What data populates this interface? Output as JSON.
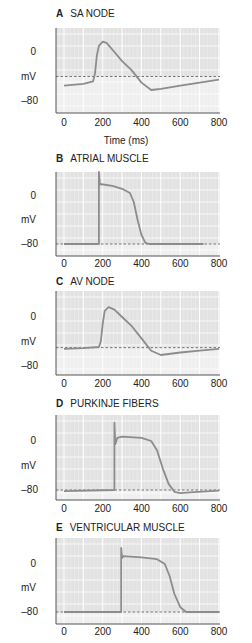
{
  "figure": {
    "xlabel": "Time (ms)",
    "ylabel": "mV",
    "colors": {
      "upper_bg": "#e2e2e2",
      "lower_bg": "#efefef",
      "grid": "#f8f8f8",
      "trace": "#8c8c8c",
      "axis": "#555555",
      "dashed": "#555555"
    }
  },
  "chart_data": [
    {
      "type": "line",
      "panel": "A",
      "title": "SA NODE",
      "xlabel": "Time (ms)",
      "ylabel": "mV",
      "xticks": [
        "0",
        "200",
        "400",
        "600",
        "800"
      ],
      "yticks": [
        "0",
        "-80"
      ],
      "xlim": [
        0,
        800
      ],
      "ylim": [
        -110,
        45
      ],
      "threshold": -40,
      "x": [
        0,
        100,
        150,
        160,
        170,
        180,
        200,
        220,
        260,
        300,
        350,
        400,
        450,
        500,
        600,
        700,
        800
      ],
      "y": [
        -55,
        -52,
        -48,
        -35,
        -5,
        10,
        17,
        15,
        0,
        -15,
        -30,
        -50,
        -62,
        -60,
        -55,
        -50,
        -45
      ]
    },
    {
      "type": "line",
      "panel": "B",
      "title": "ATRIAL MUSCLE",
      "xlabel": "",
      "ylabel": "mV",
      "xticks": [
        "0",
        "200",
        "400",
        "600",
        "800"
      ],
      "yticks": [
        "0",
        "-80"
      ],
      "xlim": [
        0,
        800
      ],
      "ylim": [
        -100,
        40
      ],
      "threshold": -80,
      "x": [
        0,
        180,
        180,
        185,
        250,
        300,
        340,
        360,
        380,
        400,
        420,
        440,
        720
      ],
      "y": [
        -80,
        -80,
        40,
        20,
        17,
        12,
        5,
        -10,
        -40,
        -65,
        -78,
        -80,
        -80
      ]
    },
    {
      "type": "line",
      "panel": "C",
      "title": "AV NODE",
      "xlabel": "",
      "ylabel": "mV",
      "xticks": [
        "0",
        "200",
        "400",
        "600",
        "800"
      ],
      "yticks": [
        "0",
        "-80"
      ],
      "xlim": [
        0,
        800
      ],
      "ylim": [
        -110,
        45
      ],
      "threshold": -50,
      "x": [
        0,
        100,
        180,
        190,
        200,
        210,
        230,
        260,
        300,
        350,
        400,
        450,
        500,
        600,
        700,
        800
      ],
      "y": [
        -52,
        -51,
        -49,
        -40,
        -10,
        10,
        16,
        12,
        0,
        -15,
        -35,
        -55,
        -62,
        -58,
        -55,
        -52
      ]
    },
    {
      "type": "line",
      "panel": "D",
      "title": "PURKINJE FIBERS",
      "xlabel": "",
      "ylabel": "mV",
      "xticks": [
        "0",
        "200",
        "400",
        "600",
        "800"
      ],
      "yticks": [
        "0",
        "-80"
      ],
      "xlim": [
        0,
        800
      ],
      "ylim": [
        -95,
        42
      ],
      "threshold": -80,
      "x": [
        0,
        260,
        260,
        265,
        275,
        300,
        400,
        450,
        480,
        510,
        540,
        570,
        600,
        650,
        800
      ],
      "y": [
        -82,
        -80,
        30,
        -5,
        5,
        7,
        5,
        0,
        -15,
        -45,
        -70,
        -83,
        -85,
        -84,
        -81
      ]
    },
    {
      "type": "line",
      "panel": "E",
      "title": "VENTRICULAR MUSCLE",
      "xlabel": "",
      "ylabel": "mV",
      "xticks": [
        "0",
        "200",
        "400",
        "600",
        "800"
      ],
      "yticks": [
        "0",
        "-80"
      ],
      "xlim": [
        0,
        800
      ],
      "ylim": [
        -100,
        42
      ],
      "threshold": -80,
      "x": [
        0,
        295,
        295,
        300,
        305,
        400,
        480,
        520,
        545,
        570,
        600,
        630,
        660,
        800
      ],
      "y": [
        -80,
        -80,
        27,
        10,
        13,
        11,
        8,
        0,
        -20,
        -50,
        -72,
        -80,
        -80,
        -80
      ]
    }
  ],
  "panels": [
    {
      "letter": "A",
      "name": "SA NODE"
    },
    {
      "letter": "B",
      "name": "ATRIAL MUSCLE"
    },
    {
      "letter": "C",
      "name": "AV NODE"
    },
    {
      "letter": "D",
      "name": "PURKINJE FIBERS"
    },
    {
      "letter": "E",
      "name": "VENTRICULAR MUSCLE"
    }
  ]
}
